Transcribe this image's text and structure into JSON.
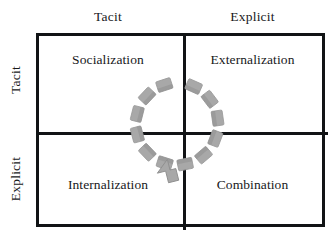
{
  "diagram": {
    "column_headers": [
      {
        "label": "Tacit"
      },
      {
        "label": "Explicit"
      }
    ],
    "row_headers": [
      {
        "label": "Tacit"
      },
      {
        "label": "Explicit"
      }
    ],
    "quadrants": [
      {
        "label": "Socialization",
        "row": "Tacit",
        "column": "Tacit"
      },
      {
        "label": "Externalization",
        "row": "Tacit",
        "column": "Explicit"
      },
      {
        "label": "Internalization",
        "row": "Explicit",
        "column": "Tacit"
      },
      {
        "label": "Combination",
        "row": "Explicit",
        "column": "Explicit"
      }
    ],
    "spiral": {
      "name": "dashed-circular-arrow",
      "direction": "counterclockwise",
      "arrow_position": "bottom",
      "dash_count": 12,
      "colors": {
        "dash_fill": "#a8a8a8",
        "dash_shade": "#8f8f8f",
        "dash_stroke": "#9a9a9a"
      }
    },
    "colors": {
      "frame": "#111315",
      "text": "#17181a",
      "background": "#ffffff"
    }
  }
}
